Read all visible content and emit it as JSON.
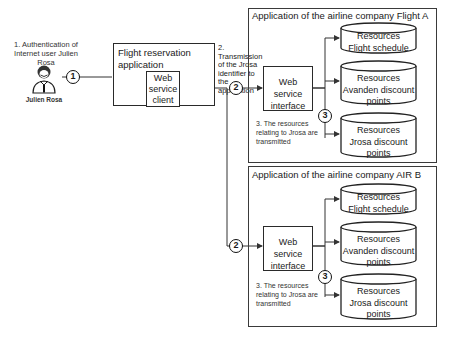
{
  "user": {
    "step_label": "1. Authentication of Internet user Julien Rosa",
    "name": "Julien Rosa",
    "icon": "person-icon"
  },
  "client_app": {
    "title": "Flight reservation application",
    "inner": "Web service client"
  },
  "transmission": {
    "label": "2. Transmission of the Jrosa identifier to the application"
  },
  "steps": {
    "one": "1",
    "two": "2",
    "three": "3"
  },
  "airline_a": {
    "title": "Application of the airline company Flight A",
    "interface": "Web service interface",
    "note": "3. The resources relating to Jrosa are transmitted",
    "resources": [
      {
        "line1": "Resources",
        "line2": "Flight schedule"
      },
      {
        "line1": "Resources",
        "line2": "Avanden discount points"
      },
      {
        "line1": "Resources",
        "line2": "Jrosa discount points"
      }
    ]
  },
  "airline_b": {
    "title": "Application of the airline company AIR B",
    "interface": "Web service interface",
    "note": "3. The resources relating to Jrosa are transmitted",
    "resources": [
      {
        "line1": "Resources",
        "line2": "Flight schedule"
      },
      {
        "line1": "Resources",
        "line2": "Avanden discount points"
      },
      {
        "line1": "Resources",
        "line2": "Jrosa discount points"
      }
    ]
  }
}
